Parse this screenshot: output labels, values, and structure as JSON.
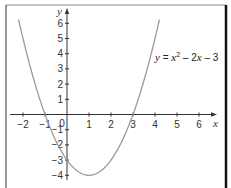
{
  "chart_data": {
    "type": "line",
    "title": "",
    "xlabel": "x",
    "ylabel": "y",
    "xlim": [
      -2.5,
      6.8
    ],
    "ylim": [
      -4.4,
      6.9
    ],
    "x_ticks": [
      -2,
      -1,
      0,
      1,
      2,
      3,
      4,
      5,
      6
    ],
    "y_ticks": [
      -4,
      -3,
      -2,
      -1,
      1,
      2,
      3,
      4,
      5,
      6
    ],
    "grid": false,
    "legend": null,
    "series": [
      {
        "name": "y = x² – 2x – 3",
        "function": "x^2 - 2x - 3",
        "x_range": [
          -2.2,
          4.2
        ],
        "roots": [
          -1,
          3
        ],
        "vertex": [
          1,
          -4
        ],
        "y_intercept": -3,
        "color": "#9a9a9a"
      }
    ],
    "annotations": [
      {
        "text": "y = x² – 2x – 3",
        "x": 4.0,
        "y": 3.5
      }
    ]
  },
  "labels": {
    "x_axis": "x",
    "y_axis": "y",
    "origin": "0",
    "equation": {
      "lhs": "y",
      "eq": " = ",
      "x1": "x",
      "sup": "2",
      "rest1": " – 2",
      "x2": "x",
      "rest2": " – 3"
    }
  },
  "colors": {
    "axis": "#333333",
    "curve": "#9a9a9a",
    "frame_top": "#8a8a8a",
    "frame_right": "#111111",
    "frame_left": "#555555"
  }
}
